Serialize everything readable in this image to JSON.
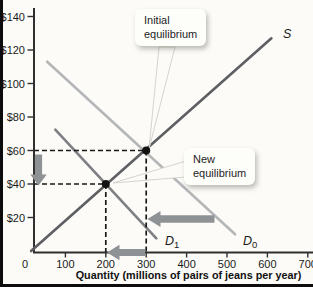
{
  "figure": {
    "background": "#fcfbf8",
    "scan_border_color": "#0c0c0c"
  },
  "chart_data": {
    "type": "line",
    "title": "",
    "xlabel": "Quantity (millions of pairs of jeans per year)",
    "ylabel": "",
    "xlim": [
      0,
      720
    ],
    "ylim": [
      0,
      150
    ],
    "grid": false,
    "x_ticks": [
      0,
      100,
      200,
      300,
      400,
      500,
      600,
      700
    ],
    "y_ticks": [
      20,
      40,
      60,
      80,
      100,
      120,
      140
    ],
    "y_tick_prefix": "$",
    "series": [
      {
        "name": "supply",
        "label": "S",
        "sub": "",
        "color": "#5d5f62",
        "points": [
          [
            15,
            0
          ],
          [
            610,
            127
          ]
        ]
      },
      {
        "name": "demand-initial",
        "label": "D",
        "sub": "0",
        "color": "#b4b6b8",
        "points": [
          [
            55,
            113
          ],
          [
            520,
            10
          ]
        ]
      },
      {
        "name": "demand-new",
        "label": "D",
        "sub": "1",
        "color": "#7d7f82",
        "points": [
          [
            75,
            72.5
          ],
          [
            325,
            7.5
          ]
        ]
      }
    ],
    "equilibria": [
      {
        "name": "initial",
        "q": 300,
        "p": 60
      },
      {
        "name": "new",
        "q": 200,
        "p": 40
      }
    ],
    "guide_color": "#191919",
    "dot_color": "#121212",
    "arrow_color": "#8f9295",
    "arrows": [
      {
        "name": "price-decrease-arrow",
        "direction": "down",
        "meaning": "price falls from $60 to $40"
      },
      {
        "name": "quantity-decrease-arrow",
        "direction": "left",
        "meaning": "quantity falls from 300 to 200"
      },
      {
        "name": "demand-shift-arrow",
        "direction": "left",
        "meaning": "demand shifts from D0 to D1"
      }
    ]
  },
  "callouts": {
    "initial": {
      "line1": "Initial",
      "line2": "equilibrium"
    },
    "new": {
      "line1": "New",
      "line2": "equilibrium"
    }
  }
}
